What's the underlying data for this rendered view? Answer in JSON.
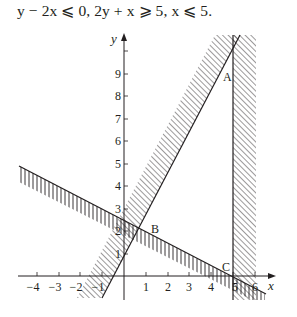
{
  "title": {
    "text": "y − 2x ⩽ 0, 2y + x ⩾ 5, x ⩽ 5."
  },
  "graph": {
    "x_axis_label": "x",
    "y_axis_label": "y",
    "x_ticks": [
      "−4",
      "−3",
      "−2",
      "−1",
      "1",
      "2",
      "3",
      "4",
      "5",
      "6"
    ],
    "y_ticks": [
      "1",
      "2",
      "3",
      "4",
      "5",
      "6",
      "7",
      "8",
      "9"
    ],
    "points": [
      {
        "label": "A"
      },
      {
        "label": "B"
      },
      {
        "label": "C"
      }
    ],
    "lines": [
      {
        "equation": "y = 2x",
        "shading": "diagonal hatch, excluded side above-left"
      },
      {
        "equation": "2y + x = 5",
        "shading": "vertical hatch, excluded side below"
      },
      {
        "equation": "x = 5",
        "shading": "diagonal hatch, excluded side right"
      }
    ],
    "colors": {
      "ink": "#231f20",
      "background": "#ffffff"
    }
  }
}
